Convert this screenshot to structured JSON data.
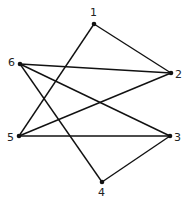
{
  "graph": {
    "nodes": [
      {
        "id": "1",
        "label": "1",
        "x": 94,
        "y": 24,
        "lx": 90,
        "ly": 16
      },
      {
        "id": "2",
        "label": "2",
        "x": 171,
        "y": 73,
        "lx": 175,
        "ly": 78
      },
      {
        "id": "3",
        "label": "3",
        "x": 170,
        "y": 136,
        "lx": 174,
        "ly": 141
      },
      {
        "id": "4",
        "label": "4",
        "x": 102,
        "y": 182,
        "lx": 98,
        "ly": 196
      },
      {
        "id": "5",
        "label": "5",
        "x": 19,
        "y": 136,
        "lx": 7,
        "ly": 141
      },
      {
        "id": "6",
        "label": "6",
        "x": 20,
        "y": 64,
        "lx": 8,
        "ly": 66
      }
    ],
    "edges": [
      [
        "1",
        "2"
      ],
      [
        "1",
        "5"
      ],
      [
        "6",
        "2"
      ],
      [
        "6",
        "3"
      ],
      [
        "6",
        "4"
      ],
      [
        "5",
        "2"
      ],
      [
        "5",
        "3"
      ],
      [
        "3",
        "4"
      ]
    ],
    "colors": {
      "line": "#111111",
      "background": "#ffffff"
    }
  }
}
